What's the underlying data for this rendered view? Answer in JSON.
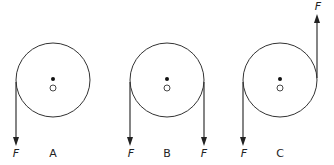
{
  "diagram": {
    "pulleys": [
      {
        "id": "A",
        "label": "A",
        "cx": 53,
        "cy": 80,
        "r": 37,
        "forces": [
          {
            "label": "F",
            "side": "left",
            "direction": "down"
          }
        ]
      },
      {
        "id": "B",
        "label": "B",
        "cx": 167,
        "cy": 80,
        "r": 37,
        "forces": [
          {
            "label": "F",
            "side": "left",
            "direction": "down"
          },
          {
            "label": "F",
            "side": "right",
            "direction": "down"
          }
        ]
      },
      {
        "id": "C",
        "label": "C",
        "cx": 280,
        "cy": 80,
        "r": 37,
        "forces": [
          {
            "label": "F",
            "side": "left",
            "direction": "down"
          },
          {
            "label": "F",
            "side": "right",
            "direction": "up"
          }
        ]
      }
    ],
    "colors": {
      "line": "#333333",
      "background": "#ffffff"
    }
  }
}
